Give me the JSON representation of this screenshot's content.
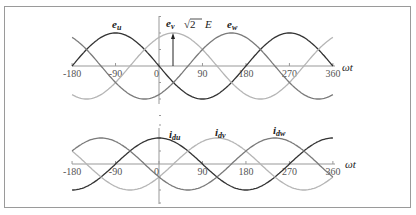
{
  "chart_data": [
    {
      "type": "line",
      "title": "",
      "xlabel": "ωt",
      "ylabel": "",
      "xlim": [
        -180,
        360
      ],
      "x_ticks": [
        "-180",
        "-90",
        "0",
        "90",
        "180",
        "270",
        "360"
      ],
      "series": [
        {
          "name": "e_u",
          "label_main": "e",
          "label_sub": "u",
          "phase_peak_deg": -90,
          "amplitude": 1,
          "color": "#333333"
        },
        {
          "name": "e_v",
          "label_main": "e",
          "label_sub": "v",
          "phase_peak_deg": 30,
          "amplitude": 1,
          "color": "#b5b5b5"
        },
        {
          "name": "e_w",
          "label_main": "e",
          "label_sub": "w",
          "phase_peak_deg": 150,
          "amplitude": 1,
          "color": "#7a7a7a"
        }
      ],
      "annotation": {
        "text_prefix": "√2",
        "text_suffix": "E",
        "at_deg": 30
      }
    },
    {
      "type": "line",
      "title": "",
      "xlabel": "ωt",
      "ylabel": "",
      "xlim": [
        -180,
        360
      ],
      "x_ticks": [
        "-180",
        "-90",
        "0",
        "90",
        "180",
        "270",
        "360"
      ],
      "series": [
        {
          "name": "i_du",
          "label_main": "i",
          "label_sub": "du",
          "phase_peak_deg": 0,
          "amplitude": 1,
          "color": "#333333"
        },
        {
          "name": "i_dv",
          "label_main": "i",
          "label_sub": "dv",
          "phase_peak_deg": 120,
          "amplitude": 1,
          "color": "#b5b5b5"
        },
        {
          "name": "i_dw",
          "label_main": "i",
          "label_sub": "dw",
          "phase_peak_deg": 240,
          "amplitude": 1,
          "color": "#7a7a7a"
        }
      ]
    }
  ],
  "top": {
    "axis_label": "ωt",
    "annotation_sqrt": "√2",
    "annotation_e": "E",
    "labels": {
      "eu": "e",
      "eu_sub": "u",
      "ev": "e",
      "ev_sub": "v",
      "ew": "e",
      "ew_sub": "w"
    }
  },
  "bottom": {
    "axis_label": "ωt",
    "labels": {
      "idu": "i",
      "idu_sub": "du",
      "idv": "i",
      "idv_sub": "dv",
      "idw": "i",
      "idw_sub": "dw"
    }
  },
  "ticks": [
    "-180",
    "-90",
    "0",
    "90",
    "180",
    "270",
    "360"
  ]
}
